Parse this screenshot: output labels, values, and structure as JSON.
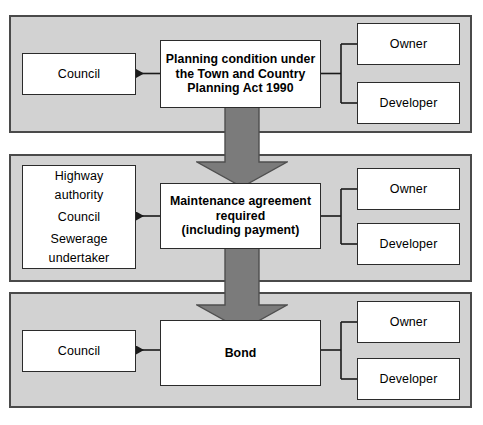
{
  "diagram": {
    "colors": {
      "panel_fill": "#d2d2d2",
      "panel_border": "#4a4a4a",
      "node_fill": "#ffffff",
      "node_border": "#2b2b2b",
      "block_arrow_fill": "#7b7b7b",
      "block_arrow_border": "#4f4f4f",
      "connector_stroke": "#1a1a1a",
      "page_background": "#ffffff"
    },
    "stages": [
      {
        "id": "stage-planning",
        "left_node": {
          "name": "left-node-council-top",
          "lines": [
            "Council"
          ]
        },
        "center_node": {
          "name": "center-node-planning-condition",
          "lines": [
            "Planning condition under",
            "the Town and Country",
            "Planning Act 1990"
          ]
        },
        "right_nodes": [
          {
            "name": "right-node-owner-top",
            "lines": [
              "Owner"
            ]
          },
          {
            "name": "right-node-developer-top",
            "lines": [
              "Developer"
            ]
          }
        ]
      },
      {
        "id": "stage-maintenance",
        "left_node": {
          "name": "left-node-authorities",
          "lines": [
            "Highway",
            "authority",
            "Council",
            "Sewerage",
            "undertaker"
          ]
        },
        "center_node": {
          "name": "center-node-maintenance-agreement",
          "lines": [
            "Maintenance agreement",
            "required",
            "(including payment)"
          ]
        },
        "right_nodes": [
          {
            "name": "right-node-owner-middle",
            "lines": [
              "Owner"
            ]
          },
          {
            "name": "right-node-developer-middle",
            "lines": [
              "Developer"
            ]
          }
        ]
      },
      {
        "id": "stage-bond",
        "left_node": {
          "name": "left-node-council-bottom",
          "lines": [
            "Council"
          ]
        },
        "center_node": {
          "name": "center-node-bond",
          "lines": [
            "Bond"
          ]
        },
        "right_nodes": [
          {
            "name": "right-node-owner-bottom",
            "lines": [
              "Owner"
            ]
          },
          {
            "name": "right-node-developer-bottom",
            "lines": [
              "Developer"
            ]
          }
        ]
      }
    ],
    "labels": {
      "council": "Council",
      "owner": "Owner",
      "developer": "Developer",
      "highway": "Highway",
      "authority": "authority",
      "sewerage": "Sewerage",
      "undertaker": "undertaker",
      "planning_l1": "Planning condition under",
      "planning_l2": "the Town and Country",
      "planning_l3": "Planning Act 1990",
      "maintenance_l1": "Maintenance agreement",
      "maintenance_l2": "required",
      "maintenance_l3": "(including payment)",
      "bond": "Bond"
    }
  }
}
